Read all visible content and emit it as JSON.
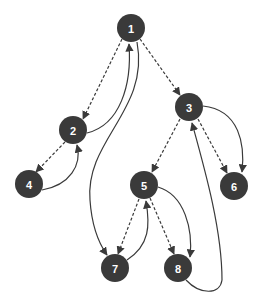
{
  "diagram": {
    "type": "graph-dfs-traversal",
    "colors": {
      "node_fill": "#3a3a3a",
      "node_text": "#ffffff",
      "edge_stroke": "#3a3a3a",
      "background": "#ffffff"
    },
    "node_radius": 14,
    "nodes": [
      {
        "id": "1",
        "label": "1",
        "x": 131,
        "y": 28
      },
      {
        "id": "2",
        "label": "2",
        "x": 73,
        "y": 130
      },
      {
        "id": "3",
        "label": "3",
        "x": 189,
        "y": 107
      },
      {
        "id": "4",
        "label": "4",
        "x": 29,
        "y": 184
      },
      {
        "id": "5",
        "label": "5",
        "x": 144,
        "y": 185
      },
      {
        "id": "6",
        "label": "6",
        "x": 234,
        "y": 186
      },
      {
        "id": "7",
        "label": "7",
        "x": 115,
        "y": 268
      },
      {
        "id": "8",
        "label": "8",
        "x": 178,
        "y": 268
      }
    ],
    "edges": [
      {
        "from": "1",
        "to": "2",
        "style": "dashed",
        "kind": "tree"
      },
      {
        "from": "1",
        "to": "3",
        "style": "dashed",
        "kind": "tree"
      },
      {
        "from": "2",
        "to": "4",
        "style": "dashed",
        "kind": "tree"
      },
      {
        "from": "3",
        "to": "5",
        "style": "dashed",
        "kind": "tree"
      },
      {
        "from": "3",
        "to": "6",
        "style": "dashed",
        "kind": "tree"
      },
      {
        "from": "5",
        "to": "7",
        "style": "dashed",
        "kind": "tree"
      },
      {
        "from": "5",
        "to": "8",
        "style": "dashed",
        "kind": "tree"
      },
      {
        "from": "4",
        "to": "2",
        "style": "solid",
        "kind": "back"
      },
      {
        "from": "2",
        "to": "1",
        "style": "solid",
        "kind": "back"
      },
      {
        "from": "1",
        "to": "7",
        "style": "solid",
        "kind": "forward"
      },
      {
        "from": "3",
        "to": "6",
        "style": "solid",
        "kind": "forward"
      },
      {
        "from": "7",
        "to": "5",
        "style": "solid",
        "kind": "back"
      },
      {
        "from": "5",
        "to": "8",
        "style": "solid",
        "kind": "forward"
      },
      {
        "from": "8",
        "to": "3",
        "style": "solid",
        "kind": "back"
      }
    ]
  }
}
